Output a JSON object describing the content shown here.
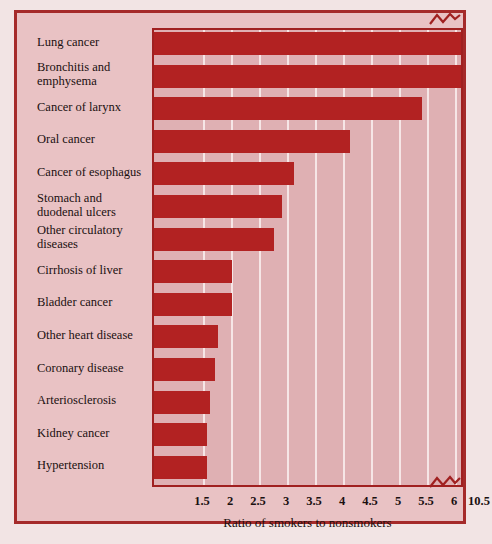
{
  "chart_data": {
    "type": "bar",
    "orientation": "horizontal",
    "title": "",
    "xlabel": "Ratio of smokers to nonsmokers",
    "ylabel": "",
    "categories": [
      "Lung cancer",
      "Bronchitis and emphysema",
      "Cancer of larynx",
      "Oral cancer",
      "Cancer of esophagus",
      "Stomach and duodenal ulcers",
      "Other circulatory diseases",
      "Cirrhosis of liver",
      "Bladder cancer",
      "Other heart disease",
      "Coronary disease",
      "Arteriosclerosis",
      "Kidney cancer",
      "Hypertension"
    ],
    "category_lines": [
      [
        "Lung cancer"
      ],
      [
        "Bronchitis and",
        "emphysema"
      ],
      [
        "Cancer of larynx"
      ],
      [
        "Oral cancer"
      ],
      [
        "Cancer of esophagus"
      ],
      [
        "Stomach and",
        "duodenal ulcers"
      ],
      [
        "Other circulatory",
        "diseases"
      ],
      [
        "Cirrhosis of liver"
      ],
      [
        "Bladder cancer"
      ],
      [
        "Other heart disease"
      ],
      [
        "Coronary disease"
      ],
      [
        "Arteriosclerosis"
      ],
      [
        "Kidney cancer"
      ],
      [
        "Hypertension"
      ]
    ],
    "values": [
      11.0,
      6.1,
      5.4,
      4.1,
      3.1,
      2.9,
      2.75,
      2.0,
      2.0,
      1.75,
      1.7,
      1.6,
      1.55,
      1.55
    ],
    "xticks": [
      "1.5",
      "2",
      "2.5",
      "3",
      "3.5",
      "4",
      "4.5",
      "5",
      "5.5",
      "6",
      "10.5",
      "11"
    ],
    "xtick_values": [
      1.5,
      2,
      2.5,
      3,
      3.5,
      4,
      4.5,
      5,
      5.5,
      6,
      10.5,
      11
    ],
    "xlim": [
      0.6,
      11.2
    ],
    "axis_break": {
      "present": true,
      "between": [
        6,
        10.5
      ],
      "label": "axis-break"
    },
    "grid": true,
    "grid_axis": "x",
    "legend": "none",
    "colors": {
      "bar": "#b22222",
      "plot_background": "#dfb0b3",
      "figure_background": "#e9c2c4",
      "page_background": "#f2e4e4",
      "frame": "#a52a2a",
      "gridline": "#f6e6e6",
      "text": "#1a1010"
    }
  }
}
